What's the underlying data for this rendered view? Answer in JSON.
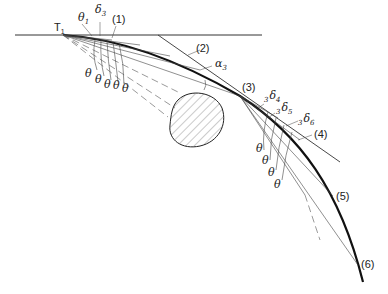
{
  "diagram": {
    "labels": {
      "t1": {
        "main": "T",
        "sub": "1"
      },
      "theta1": {
        "main": "θ",
        "sub": "1"
      },
      "delta3": {
        "main": "δ",
        "sub": "3"
      },
      "alpha3": {
        "main": "α",
        "sub": "3"
      },
      "d34": {
        "pre": "3",
        "main": "δ",
        "sub": "4"
      },
      "d35": {
        "pre": "3",
        "main": "δ",
        "sub": "5"
      },
      "d36": {
        "pre": "3",
        "main": "δ",
        "sub": "6"
      },
      "theta": "θ"
    },
    "points": [
      "(1)",
      "(2)",
      "(3)",
      "(4)",
      "(5)",
      "(6)"
    ],
    "colors": {
      "line": "#222222",
      "hatch": "#555555",
      "background": "#ffffff"
    }
  }
}
